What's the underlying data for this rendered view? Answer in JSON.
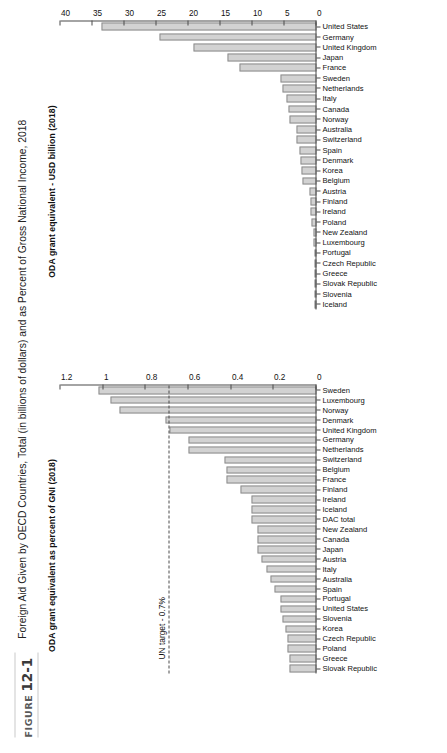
{
  "figure": {
    "badge_label": "FIGURE",
    "badge_number": "12-1",
    "title": "Foreign Aid Given by OECD Countries, Total (in billions of dollars) and as Percent of Gross National Income, 2018"
  },
  "annotations": {
    "un_target_label": "UN target - 0.7%",
    "un_target_value": 0.7
  },
  "colors": {
    "bar_fill": "#d2d2d2",
    "bar_stroke": "#8d8d8d",
    "axis": "#4a4a4a",
    "text": "#111111",
    "badge_text": "#5a5a5a"
  },
  "chart_data": [
    {
      "type": "bar",
      "id": "oda-percent-gni",
      "title": "ODA grant equivalent as percent of GNI (2018)",
      "xlabel": "",
      "ylabel": "",
      "ylim": [
        0,
        1.2
      ],
      "yticks": [
        0,
        0.2,
        0.4,
        0.6,
        0.8,
        1,
        1.2
      ],
      "ytick_labels": [
        "0",
        "0.2",
        "0.4",
        "0.6",
        "0.8",
        "1",
        "1.2"
      ],
      "grid": false,
      "legend": "none",
      "annotation_line": {
        "label": "UN target - 0.7%",
        "value": 0.7,
        "style": "dashed"
      },
      "categories": [
        "Slovak Republic",
        "Greece",
        "Poland",
        "Czech Republic",
        "Korea",
        "Slovenia",
        "United States",
        "Portugal",
        "Spain",
        "Australia",
        "Italy",
        "Austria",
        "Japan",
        "Canada",
        "New Zealand",
        "DAC total",
        "Iceland",
        "Ireland",
        "Finland",
        "France",
        "Belgium",
        "Switzerland",
        "Netherlands",
        "Germany",
        "United Kingdom",
        "Denmark",
        "Norway",
        "Luxembourg",
        "Sweden"
      ],
      "values": [
        0.13,
        0.13,
        0.14,
        0.14,
        0.15,
        0.16,
        0.17,
        0.17,
        0.2,
        0.22,
        0.24,
        0.26,
        0.28,
        0.28,
        0.28,
        0.31,
        0.31,
        0.31,
        0.36,
        0.43,
        0.43,
        0.44,
        0.61,
        0.61,
        0.7,
        0.72,
        0.94,
        0.98,
        1.04
      ]
    },
    {
      "type": "bar",
      "id": "oda-usd-billion",
      "title": "ODA grant equivalent - USD billion (2018)",
      "xlabel": "",
      "ylabel": "",
      "ylim": [
        0,
        40
      ],
      "yticks": [
        0,
        5,
        10,
        15,
        20,
        25,
        30,
        35,
        40
      ],
      "ytick_labels": [
        "0",
        "5",
        "10",
        "15",
        "20",
        "25",
        "30",
        "35",
        "40"
      ],
      "grid": false,
      "legend": "none",
      "categories": [
        "Iceland",
        "Slovenia",
        "Slovak Republic",
        "Greece",
        "Czech Republic",
        "Portugal",
        "Luxembourg",
        "New Zealand",
        "Poland",
        "Ireland",
        "Finland",
        "Austria",
        "Belgium",
        "Korea",
        "Denmark",
        "Spain",
        "Switzerland",
        "Australia",
        "Norway",
        "Canada",
        "Italy",
        "Netherlands",
        "Sweden",
        "France",
        "Japan",
        "United Kingdom",
        "Germany",
        "United States"
      ],
      "values": [
        0.07,
        0.08,
        0.13,
        0.29,
        0.31,
        0.37,
        0.45,
        0.55,
        0.76,
        0.93,
        0.98,
        1.17,
        2.3,
        2.36,
        2.58,
        2.66,
        3.1,
        3.15,
        4.26,
        4.39,
        4.7,
        5.4,
        5.79,
        12.15,
        14.17,
        19.55,
        24.98,
        34.15
      ]
    }
  ]
}
